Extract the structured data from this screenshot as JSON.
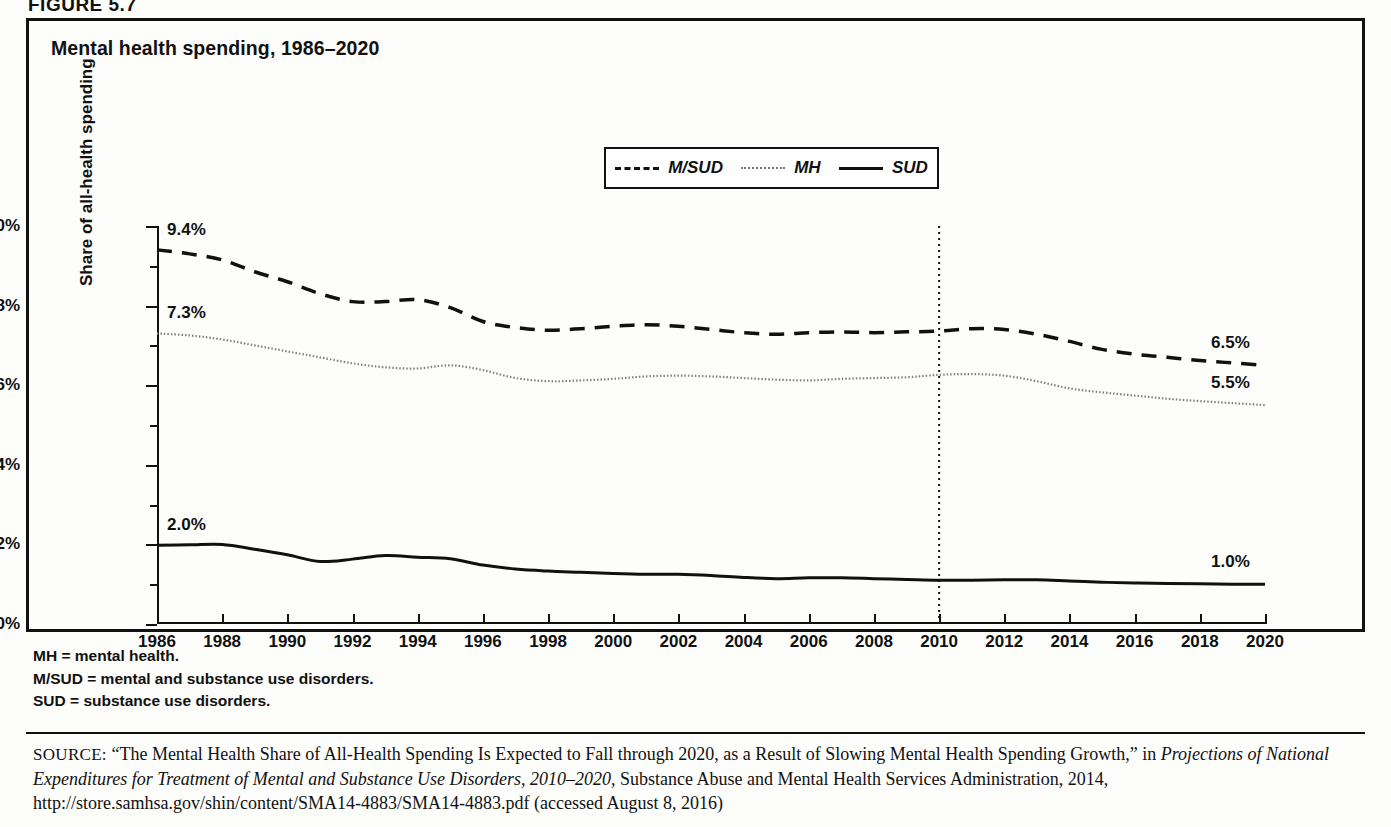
{
  "figure": {
    "label": "FIGURE 5.7",
    "title": "Mental health spending, 1986–2020"
  },
  "legend": {
    "items": [
      {
        "label": "M/SUD",
        "style": "dashed",
        "icon": "dashed-line-icon"
      },
      {
        "label": "MH",
        "style": "dotted",
        "icon": "dotted-line-icon"
      },
      {
        "label": "SUD",
        "style": "solid",
        "icon": "solid-line-icon"
      }
    ]
  },
  "axes": {
    "y_title": "Share of all-health spending",
    "y_ticks": [
      "0%",
      "2%",
      "4%",
      "6%",
      "8%",
      "10%"
    ],
    "x_ticks": [
      "1986",
      "1988",
      "1990",
      "1992",
      "1994",
      "1996",
      "1998",
      "2000",
      "2002",
      "2004",
      "2006",
      "2008",
      "2010",
      "2012",
      "2014",
      "2016",
      "2018",
      "2020"
    ]
  },
  "annotations": {
    "msud_start": "9.4%",
    "mh_start": "7.3%",
    "sud_start": "2.0%",
    "msud_end": "6.5%",
    "mh_end": "5.5%",
    "sud_end": "1.0%"
  },
  "notes": [
    "MH = mental health.",
    "M/SUD = mental and substance use disorders.",
    "SUD = substance use disorders."
  ],
  "source": {
    "kicker": "SOURCE:",
    "part1": " “The Mental Health Share of All-Health Spending Is Expected to Fall through 2020, as a Result of Slowing Mental Health Spending Growth,” in ",
    "italic": "Projections of National Expenditures for Treatment of Mental and Substance Use Disorders, 2010–2020",
    "part2": ", Substance Abuse and Mental Health Services Administration, 2014, http://store.samhsa.gov/shin/content/SMA14-4883/SMA14-4883.pdf (accessed August 8, 2016)"
  },
  "chart_data": {
    "type": "line",
    "title": "Mental health spending, 1986–2020",
    "xlabel": "",
    "ylabel": "Share of all-health spending",
    "xlim": [
      1986,
      2020
    ],
    "ylim": [
      0,
      10
    ],
    "ytick_step": 2,
    "yminor_step": 1,
    "xtick_step": 2,
    "grid": false,
    "legend_position": "top-center",
    "units": "percent",
    "reference_line": {
      "x": 2010,
      "style": "dotted",
      "note": "actual vs. projected boundary"
    },
    "x": [
      1986,
      1987,
      1988,
      1989,
      1990,
      1991,
      1992,
      1993,
      1994,
      1995,
      1996,
      1997,
      1998,
      1999,
      2000,
      2001,
      2002,
      2003,
      2004,
      2005,
      2006,
      2007,
      2008,
      2009,
      2010,
      2011,
      2012,
      2013,
      2014,
      2015,
      2016,
      2017,
      2018,
      2019,
      2020
    ],
    "series": [
      {
        "name": "M/SUD",
        "style": "dashed",
        "start_label": "9.4%",
        "end_label": "6.5%",
        "values": [
          9.4,
          9.3,
          9.15,
          8.85,
          8.6,
          8.3,
          8.1,
          8.1,
          8.15,
          7.95,
          7.6,
          7.45,
          7.38,
          7.42,
          7.48,
          7.52,
          7.48,
          7.4,
          7.32,
          7.28,
          7.32,
          7.34,
          7.32,
          7.34,
          7.36,
          7.42,
          7.4,
          7.28,
          7.1,
          6.9,
          6.78,
          6.7,
          6.62,
          6.56,
          6.5
        ]
      },
      {
        "name": "MH",
        "style": "dotted",
        "start_label": "7.3%",
        "end_label": "5.5%",
        "values": [
          7.3,
          7.25,
          7.15,
          7.0,
          6.85,
          6.7,
          6.55,
          6.45,
          6.42,
          6.5,
          6.38,
          6.18,
          6.1,
          6.12,
          6.16,
          6.22,
          6.24,
          6.22,
          6.18,
          6.14,
          6.12,
          6.16,
          6.18,
          6.2,
          6.26,
          6.28,
          6.24,
          6.1,
          5.92,
          5.82,
          5.74,
          5.66,
          5.6,
          5.55,
          5.5
        ]
      },
      {
        "name": "SUD",
        "style": "solid",
        "start_label": "2.0%",
        "end_label": "1.0%",
        "values": [
          1.98,
          1.99,
          2.0,
          1.88,
          1.74,
          1.57,
          1.63,
          1.72,
          1.68,
          1.64,
          1.48,
          1.38,
          1.33,
          1.3,
          1.27,
          1.25,
          1.25,
          1.22,
          1.17,
          1.14,
          1.16,
          1.16,
          1.14,
          1.12,
          1.1,
          1.1,
          1.11,
          1.11,
          1.08,
          1.05,
          1.03,
          1.02,
          1.01,
          1.0,
          1.0
        ]
      }
    ]
  }
}
